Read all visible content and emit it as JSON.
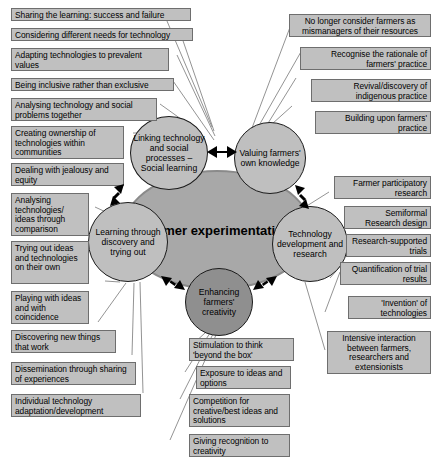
{
  "diagram": {
    "title": "Farmer experimentation",
    "core": {
      "label": "Farmer experimentation",
      "fill": "#a8a8a8",
      "stroke": "#8a8a8a"
    },
    "colors": {
      "node_fill": "#bfbfbf",
      "node_fill_dark": "#8f8f8f",
      "node_stroke": "#1b1b1b",
      "box_fill": "#c0c0c0",
      "box_stroke": "#6e6e6e",
      "connector": "#777777",
      "background": "#ffffff",
      "text": "#000000"
    },
    "nodes": [
      {
        "id": "linking",
        "label": "Linking technology and social processes – Social learning",
        "shade": "light"
      },
      {
        "id": "valuing",
        "label": "Valuing farmers' own knowledge",
        "shade": "light"
      },
      {
        "id": "learning",
        "label": "Learning through discovery and trying out",
        "shade": "light"
      },
      {
        "id": "techdev",
        "label": "Technology development and research",
        "shade": "light"
      },
      {
        "id": "enhancing",
        "label": "Enhancing farmers' creativity",
        "shade": "dark"
      }
    ],
    "groups": {
      "linking": [
        "Sharing the learning: success and failure",
        "Considering different needs for technology",
        "Adapting technologies to prevalent values",
        "Being inclusive rather than exclusive",
        "Analysing technology and social problems together",
        "Creating ownership of technologies within communities",
        "Dealing with jealousy and equity"
      ],
      "valuing": [
        "No longer consider farmers as mismanagers of their resources",
        "Recognise the rationale of farmers' practice",
        "Revival/discovery of indigenous practice",
        "Building upon farmers' practice"
      ],
      "learning": [
        "Analysing technologies/ ideas through comparison",
        "Trying out ideas and technologies on their own",
        "Playing with ideas and with coincidence",
        "Discovering new things that work",
        "Dissemination through sharing of experiences",
        "Individual technology adaptation/development"
      ],
      "techdev": [
        "Farmer participatory research",
        "Semiformal Research design",
        "Research-supported trials",
        "Quantification of trial results",
        "'Invention' of technologies",
        "Intensive interaction between farmers, researchers and extensionists"
      ],
      "enhancing": [
        "Stimulation to think 'beyond the box'",
        "Exposure to ideas and options",
        "Competition for creative/best ideas and solutions",
        "Giving recognition to creativity"
      ]
    }
  }
}
